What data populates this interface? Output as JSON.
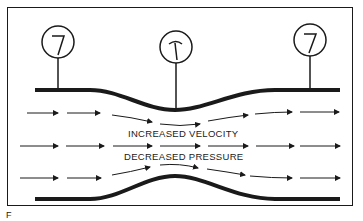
{
  "diagram": {
    "type": "venturi-tube",
    "labels": {
      "velocity": "INCREASED VELOCITY",
      "pressure": "DECREASED PRESSURE"
    },
    "gauges": [
      {
        "name": "inlet-pressure-gauge",
        "reading": "high"
      },
      {
        "name": "throat-pressure-gauge",
        "reading": "low"
      },
      {
        "name": "outlet-pressure-gauge",
        "reading": "high"
      }
    ],
    "caption": "F"
  }
}
